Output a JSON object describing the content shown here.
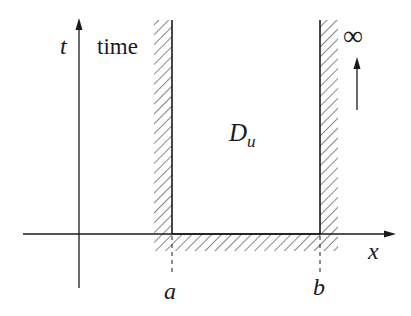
{
  "diagram": {
    "axes": {
      "vertical_label": "t",
      "horizontal_label": "x",
      "vertical_caption": "time"
    },
    "region": {
      "label_main": "D",
      "label_sub": "u"
    },
    "boundaries": {
      "left_label": "a",
      "right_label": "b"
    },
    "infinity": {
      "symbol": "∞"
    },
    "colors": {
      "ink": "#1a1a1a",
      "hatch": "#555555",
      "background": "#ffffff"
    }
  }
}
